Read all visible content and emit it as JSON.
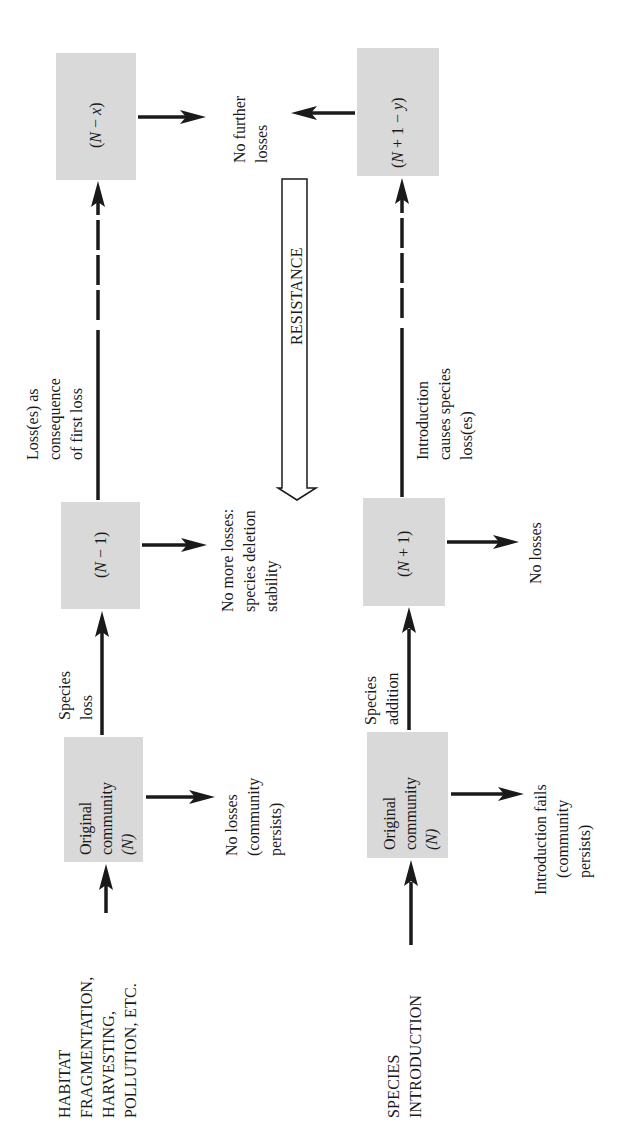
{
  "diagram": {
    "orientation": "rotated -90deg (read with page turned clockwise)",
    "pathways": [
      {
        "name": "loss pathway",
        "driver_label": [
          "HABITAT",
          "FRAGMENTATION,",
          "HARVESTING,",
          "POLLUTION, ETC."
        ],
        "nodes": [
          {
            "id": "orig_top",
            "label_lines": [
              "Original",
              "community",
              "(N)"
            ],
            "outcome_lines": [
              "No losses",
              "(community",
              "persists)"
            ]
          },
          {
            "id": "n_minus_1",
            "label": "(N − 1)",
            "label_parts": [
              "(",
              "N",
              " − 1)"
            ],
            "outcome_lines": [
              "No more losses:",
              "species deletion",
              "stability"
            ]
          },
          {
            "id": "n_minus_x",
            "label": "(N − x)",
            "label_parts": [
              "(",
              "N",
              " − ",
              "x",
              ")"
            ],
            "outcome_lines": [
              "No further",
              "losses"
            ]
          }
        ],
        "edges": [
          {
            "from": "driver",
            "to": "orig_top",
            "style": "solid"
          },
          {
            "from": "orig_top",
            "to": "n_minus_1",
            "style": "solid",
            "label_lines": [
              "Species",
              "loss"
            ]
          },
          {
            "from": "n_minus_1",
            "to": "n_minus_x",
            "style": "solid-then-dashed",
            "label_lines": [
              "Loss(es) as",
              "consequence",
              "of first loss"
            ]
          }
        ]
      },
      {
        "name": "introduction pathway",
        "driver_label": [
          "SPECIES",
          "INTRODUCTION"
        ],
        "nodes": [
          {
            "id": "orig_bottom",
            "label_lines": [
              "Original",
              "community",
              "(N)"
            ],
            "outcome_lines": [
              "Introduction fails",
              "(community",
              "persists)"
            ]
          },
          {
            "id": "n_plus_1",
            "label": "(N + 1)",
            "label_parts": [
              "(",
              "N",
              " + 1)"
            ],
            "outcome_lines": [
              "No losses"
            ]
          },
          {
            "id": "n_plus_1_minus_y",
            "label": "(N + 1 − y)",
            "label_parts": [
              "(",
              "N",
              " + 1 − ",
              "y",
              ")"
            ],
            "outcome_lines": [
              "No further",
              "losses"
            ]
          }
        ],
        "edges": [
          {
            "from": "driver",
            "to": "orig_bottom",
            "style": "solid"
          },
          {
            "from": "orig_bottom",
            "to": "n_plus_1",
            "style": "solid",
            "label_lines": [
              "Species",
              "addition"
            ]
          },
          {
            "from": "n_plus_1",
            "to": "n_plus_1_minus_y",
            "style": "solid-then-dashed",
            "label_lines": [
              "Introduction",
              "causes species",
              "loss(es)"
            ]
          }
        ]
      }
    ],
    "shared_outcome": [
      "No further",
      "losses"
    ],
    "gradient_arrow": {
      "label": "RESISTANCE",
      "direction": "toward first-stage outcomes"
    },
    "colors": {
      "box_fill": "#d9d9d9",
      "ink": "#1a1a1a",
      "background": "#ffffff"
    }
  }
}
